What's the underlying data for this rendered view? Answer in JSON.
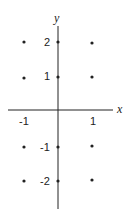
{
  "axes": {
    "x_label": "x",
    "y_label": "y",
    "x_ticks": [
      {
        "value": -1,
        "label": "-1"
      },
      {
        "value": 1,
        "label": "1"
      }
    ],
    "y_ticks": [
      {
        "value": 2,
        "label": "2"
      },
      {
        "value": 1,
        "label": "1"
      },
      {
        "value": -1,
        "label": "-1"
      },
      {
        "value": -2,
        "label": "-2"
      }
    ]
  },
  "points": [
    {
      "x": -1,
      "y": 2
    },
    {
      "x": 0,
      "y": 2
    },
    {
      "x": 1,
      "y": 2
    },
    {
      "x": -1,
      "y": 1
    },
    {
      "x": 0,
      "y": 1
    },
    {
      "x": 1,
      "y": 1
    },
    {
      "x": -1,
      "y": -1
    },
    {
      "x": 0,
      "y": -1
    },
    {
      "x": 1,
      "y": -1
    },
    {
      "x": -1,
      "y": -2
    },
    {
      "x": 0,
      "y": -2
    },
    {
      "x": 1,
      "y": -2
    }
  ],
  "colors": {
    "ink": "#222222",
    "background": "#ffffff"
  }
}
